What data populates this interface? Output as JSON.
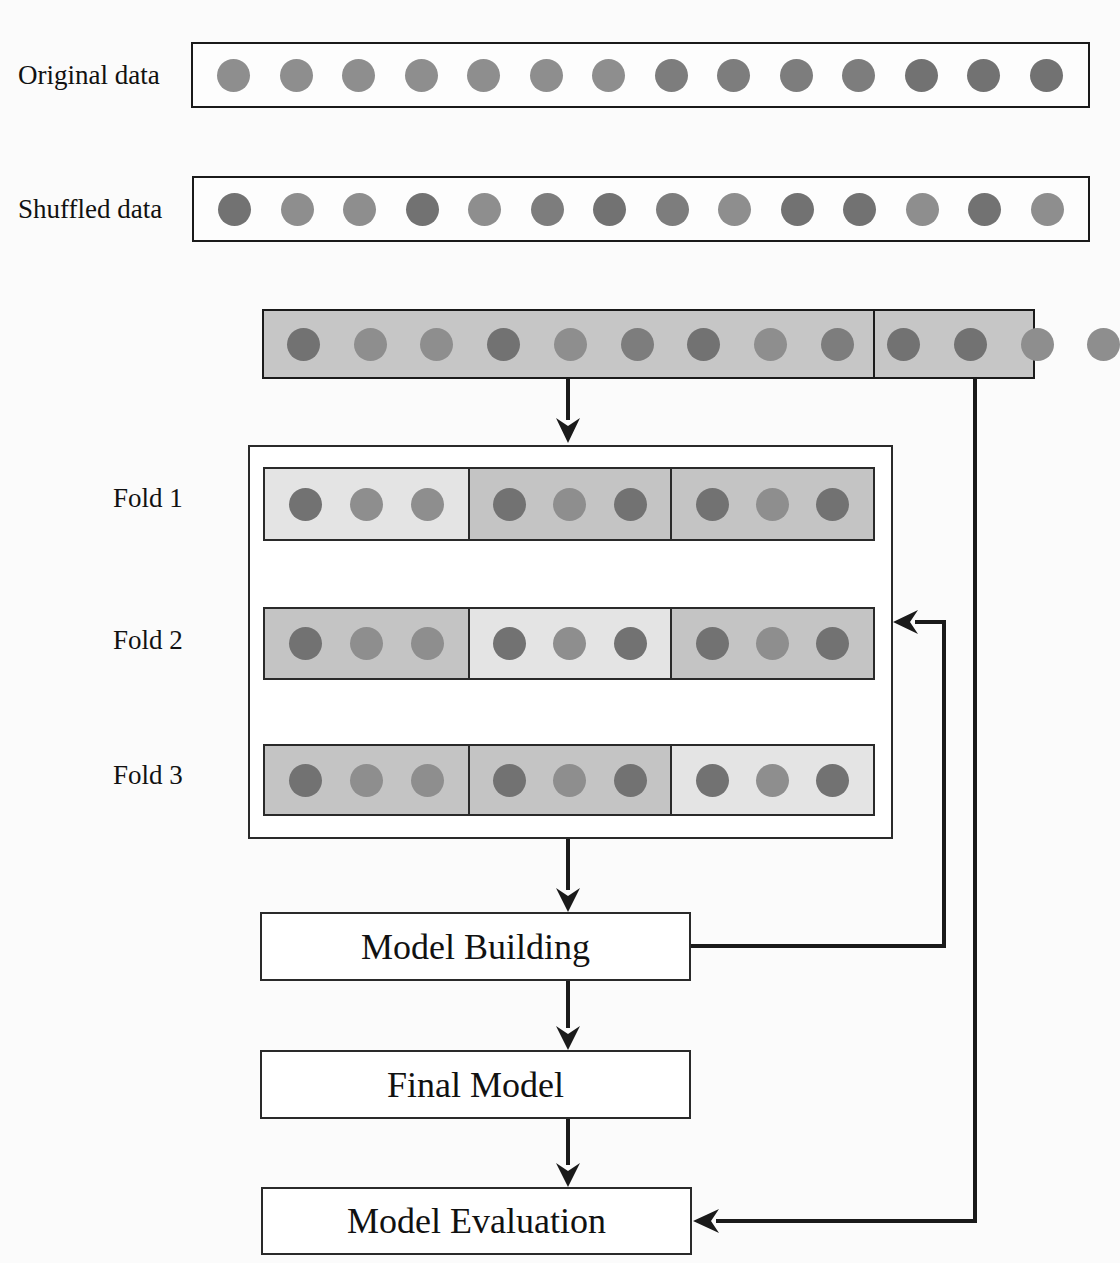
{
  "rows": {
    "original": {
      "label": "Original data",
      "dots": [
        2,
        2,
        2,
        2,
        2,
        2,
        2,
        1,
        1,
        1,
        1,
        3,
        3,
        3
      ]
    },
    "shuffled": {
      "label": "Shuffled data",
      "dots": [
        3,
        2,
        2,
        3,
        2,
        1,
        3,
        1,
        2,
        3,
        3,
        2,
        3,
        2
      ]
    },
    "partitioned": {
      "dots": [
        3,
        2,
        2,
        3,
        2,
        1,
        3,
        2,
        1,
        3,
        3,
        2,
        2
      ]
    }
  },
  "folds": [
    {
      "label": "Fold 1",
      "test_segment": 0
    },
    {
      "label": "Fold 2",
      "test_segment": 1
    },
    {
      "label": "Fold 3",
      "test_segment": 2
    }
  ],
  "steps": {
    "model_building": "Model Building",
    "final_model": "Final Model",
    "model_evaluation": "Model Evaluation"
  },
  "colors": {
    "train_segment": "#c4c4c4",
    "test_segment": "#e4e4e4",
    "dot_dark": "#727272",
    "dot_mid": "#7d7d7d",
    "dot_light": "#8e8e8e",
    "line": "#1a1a1a"
  }
}
